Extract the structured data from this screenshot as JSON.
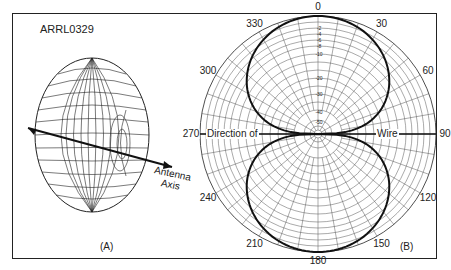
{
  "figure": {
    "id_label": "ARRL0329",
    "panel_a_label": "(A)",
    "panel_b_label": "(B)",
    "axis_label_line1": "Antenna",
    "axis_label_line2": "Axis",
    "direction_left": "Direction of",
    "direction_right": "Wire"
  },
  "chart_data": {
    "type": "polar",
    "angle_ticks": [
      "0",
      "30",
      "60",
      "90",
      "120",
      "150",
      "180",
      "210",
      "240",
      "270",
      "300",
      "330"
    ],
    "radial_ticks_db": [
      "-2",
      "-4",
      "-6",
      "-8",
      "-10",
      "-20",
      "-30",
      "-40",
      "-50"
    ],
    "pattern": "figure-eight, maxima at 0 and 180 deg, nulls at 90 and 270 deg (along wire)",
    "series": [
      {
        "name": "pattern",
        "angles_deg": [
          0,
          30,
          60,
          75,
          85,
          90,
          95,
          105,
          120,
          150,
          180,
          210,
          240,
          255,
          265,
          270,
          275,
          285,
          300,
          330
        ],
        "relative_db": [
          0,
          -1.2,
          -6,
          -12,
          -25,
          -50,
          -25,
          -12,
          -6,
          -1.2,
          0,
          -1.2,
          -6,
          -12,
          -25,
          -50,
          -25,
          -12,
          -6,
          -1.2
        ]
      }
    ]
  }
}
